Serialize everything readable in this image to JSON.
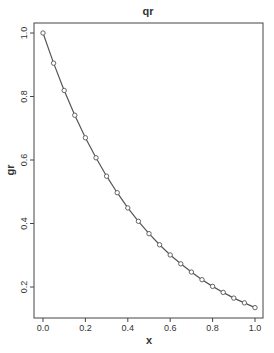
{
  "chart_data": {
    "type": "line",
    "title": "qr",
    "xlabel": "x",
    "ylabel": "gr",
    "xlim": [
      0,
      1
    ],
    "ylim": [
      0.135,
      1.0
    ],
    "x_ticks": [
      "0.0",
      "0.2",
      "0.4",
      "0.6",
      "0.8",
      "1.0"
    ],
    "y_ticks": [
      "0.2",
      "0.4",
      "0.6",
      "0.8",
      "1.0"
    ],
    "grid": false,
    "legend": null,
    "series": [
      {
        "name": "gr",
        "markers": "open-circle",
        "x": [
          0,
          0.05,
          0.1,
          0.15,
          0.2,
          0.25,
          0.3,
          0.35,
          0.4,
          0.45,
          0.5,
          0.55,
          0.6,
          0.65,
          0.7,
          0.75,
          0.8,
          0.85,
          0.9,
          0.95,
          1.0
        ],
        "y": [
          1.0,
          0.905,
          0.819,
          0.741,
          0.67,
          0.607,
          0.549,
          0.497,
          0.449,
          0.407,
          0.368,
          0.333,
          0.301,
          0.273,
          0.247,
          0.223,
          0.202,
          0.183,
          0.165,
          0.15,
          0.135
        ]
      }
    ]
  },
  "colors": {
    "line": "#555555",
    "axis": "#444444"
  }
}
